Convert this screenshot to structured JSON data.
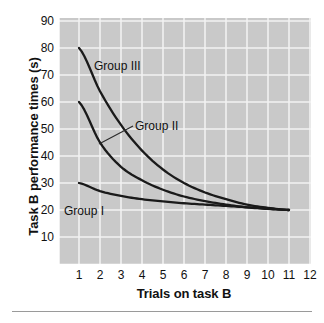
{
  "figure": {
    "background_color": "#ffffff",
    "plot_background_color": "#c9c9c9",
    "gridline_color": "#f2f2f2",
    "axis_color": "#ffffff",
    "curve_color": "#1a1a1a",
    "footer_rule_color": "#9a9a9a"
  },
  "chart_data": {
    "type": "line",
    "title": "",
    "xlabel": "Trials on task B",
    "ylabel": "Task B performance times (s)",
    "xlim": [
      0,
      12
    ],
    "ylim": [
      0,
      95
    ],
    "xticks": [
      "1",
      "2",
      "3",
      "4",
      "5",
      "6",
      "7",
      "8",
      "9",
      "10",
      "11",
      "12"
    ],
    "yticks": [
      "10",
      "20",
      "30",
      "40",
      "50",
      "60",
      "70",
      "80",
      "90"
    ],
    "grid": true,
    "legend_position": "inline-annotations",
    "x": [
      1,
      2,
      3,
      4,
      5,
      6,
      7,
      8,
      9,
      10,
      11
    ],
    "series": [
      {
        "name": "Group I",
        "label": "Group I",
        "values": [
          30.0,
          27.0,
          25.2,
          24.0,
          23.2,
          22.5,
          22.0,
          21.5,
          21.0,
          20.5,
          20.0
        ]
      },
      {
        "name": "Group II",
        "label": "Group II",
        "values": [
          60.0,
          45.0,
          36.0,
          31.0,
          27.5,
          25.0,
          23.3,
          22.0,
          21.0,
          20.4,
          20.0
        ]
      },
      {
        "name": "Group III",
        "label": "Group III",
        "values": [
          80.0,
          64.0,
          51.5,
          42.0,
          35.0,
          30.0,
          26.5,
          24.0,
          22.0,
          20.8,
          20.0
        ]
      }
    ],
    "annotations": [
      {
        "text": "Group III",
        "target_series": "Group III",
        "has_leader_line": false
      },
      {
        "text": "Group II",
        "target_series": "Group II",
        "has_leader_line": true
      },
      {
        "text": "Group I",
        "target_series": "Group I",
        "has_leader_line": false
      }
    ]
  }
}
